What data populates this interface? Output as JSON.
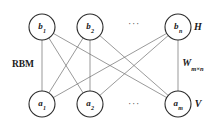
{
  "diagram": {
    "type": "bipartite-graph",
    "side_label": "RBM",
    "weight_label": {
      "symbol": "W",
      "subscript": "m×n"
    },
    "layers": [
      {
        "id": "hidden",
        "layer_label": "H",
        "label_x": 198,
        "label_y": 27,
        "y": 27,
        "nodes": [
          {
            "id": "h1",
            "base": "b",
            "sub": "1",
            "cx": 42,
            "cy": 27,
            "r": 13
          },
          {
            "id": "h2",
            "base": "b",
            "sub": "2",
            "cx": 90,
            "cy": 27,
            "r": 13
          },
          {
            "id": "hn",
            "base": "b",
            "sub": "n",
            "cx": 178,
            "cy": 27,
            "r": 13
          }
        ],
        "ellipsis": {
          "text": "···",
          "x": 134,
          "y": 24
        }
      },
      {
        "id": "visible",
        "layer_label": "V",
        "label_x": 198,
        "label_y": 104,
        "y": 104,
        "nodes": [
          {
            "id": "v1",
            "base": "a",
            "sub": "1",
            "cx": 42,
            "cy": 104,
            "r": 13
          },
          {
            "id": "v2",
            "base": "a",
            "sub": "2",
            "cx": 90,
            "cy": 104,
            "r": 13
          },
          {
            "id": "vm",
            "base": "a",
            "sub": "m",
            "cx": 178,
            "cy": 104,
            "r": 13
          }
        ],
        "ellipsis": {
          "text": "···",
          "x": 134,
          "y": 104
        }
      }
    ],
    "edges": [
      {
        "from": "h1",
        "to": "v1"
      },
      {
        "from": "h1",
        "to": "v2"
      },
      {
        "from": "h1",
        "to": "vm"
      },
      {
        "from": "h2",
        "to": "v1"
      },
      {
        "from": "h2",
        "to": "v2"
      },
      {
        "from": "h2",
        "to": "vm"
      },
      {
        "from": "hn",
        "to": "v1"
      },
      {
        "from": "hn",
        "to": "v2"
      },
      {
        "from": "hn",
        "to": "vm"
      }
    ],
    "side_label_pos": {
      "x": 23,
      "y": 65
    },
    "weight_label_pos": {
      "x": 193,
      "y": 64
    },
    "colors": {
      "background": "#ffffff",
      "node_stroke": "#2b2b2b",
      "node_fill": "#ffffff",
      "edge": "#6e6e6e",
      "text": "#1a1a1a"
    }
  }
}
